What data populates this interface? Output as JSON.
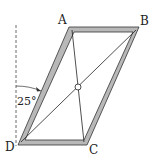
{
  "labels": {
    "A": "A",
    "B": "B",
    "C": "C",
    "D": "D"
  },
  "angle_label": "25°",
  "colors": {
    "frame_fill": "#b8b8b8",
    "frame_stroke": "#333333",
    "line": "#222222"
  }
}
